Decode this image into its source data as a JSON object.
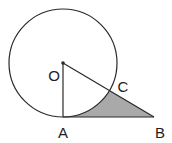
{
  "diagram": {
    "type": "geometry",
    "colors": {
      "stroke": "#2a2a2a",
      "shade": "#a9a9a9",
      "background": "#ffffff"
    },
    "points": {
      "O": {
        "label": "O",
        "x": 63,
        "y": 63
      },
      "A": {
        "label": "A",
        "x": 63,
        "y": 117
      },
      "B": {
        "label": "B",
        "x": 154,
        "y": 117
      },
      "C": {
        "label": "C",
        "x": 109.4,
        "y": 90.6
      }
    },
    "circle": {
      "center": "O",
      "radius": 54
    },
    "segments": [
      {
        "from": "O",
        "to": "A"
      },
      {
        "from": "O",
        "to": "B"
      },
      {
        "from": "A",
        "to": "B"
      }
    ],
    "shaded_region": {
      "boundary": [
        "A",
        "B",
        "C",
        "arc C-A"
      ]
    },
    "labels": {
      "O": "O",
      "A": "A",
      "B": "B",
      "C": "C"
    }
  }
}
